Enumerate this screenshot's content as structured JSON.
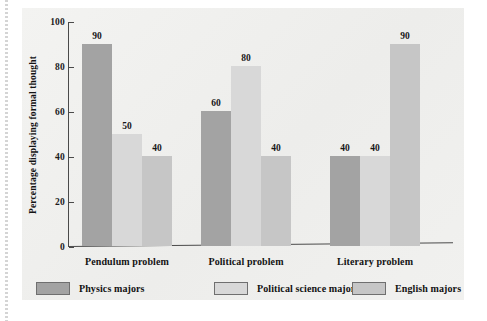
{
  "chart_data": {
    "type": "bar",
    "title": "",
    "xlabel": "",
    "ylabel": "Percentage displaying formal thought",
    "ylim": [
      0,
      100
    ],
    "yticks": [
      "0",
      "20",
      "40",
      "60",
      "80",
      "100"
    ],
    "grid": false,
    "legend_position": "bottom",
    "categories": [
      "Pendulum problem",
      "Political problem",
      "Literary problem"
    ],
    "series": [
      {
        "name": "Physics majors",
        "color": "#a3a3a3",
        "values": [
          90,
          60,
          40
        ],
        "labels": [
          "90",
          "60",
          "40"
        ]
      },
      {
        "name": "Political science majors",
        "color": "#d8d8d8",
        "values": [
          50,
          80,
          40
        ],
        "labels": [
          "50",
          "80",
          "40"
        ]
      },
      {
        "name": "English majors",
        "color": "#c6c6c6",
        "values": [
          40,
          40,
          90
        ],
        "labels": [
          "40",
          "40",
          "90"
        ]
      }
    ]
  },
  "colors": {
    "page_background": "#ffffff",
    "figure_background": "#f0f0ee",
    "axis": "#4a4a4a",
    "text": "#131313",
    "series_physics": "#a3a3a3",
    "series_polisci": "#d8d8d8",
    "series_english": "#c6c6c6"
  }
}
